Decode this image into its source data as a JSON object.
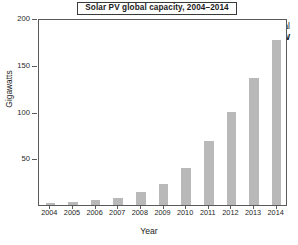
{
  "chart_data": {
    "type": "bar",
    "title": "Solar PV global capacity, 2004–2014",
    "xlabel": "Year",
    "ylabel": "Gigawatts",
    "categories": [
      "2004",
      "2005",
      "2006",
      "2007",
      "2008",
      "2009",
      "2010",
      "2011",
      "2012",
      "2013",
      "2014"
    ],
    "values": [
      2,
      3.5,
      5,
      7,
      14,
      22,
      40,
      68,
      99,
      136,
      177
    ],
    "ylim": [
      0,
      200
    ],
    "yticks": [
      0,
      50,
      100,
      150,
      200
    ],
    "ytick_labels": [
      "",
      "50",
      "100",
      "150",
      "200"
    ],
    "grid": false,
    "legend": null,
    "bar_color": "#b9b9b9",
    "frame_color": "#5a5a5a",
    "annotations": [
      {
        "line1": "World total",
        "line2": "177 GW"
      }
    ]
  },
  "axis": {
    "y_tick_values": [
      "200",
      "150",
      "100",
      "50"
    ],
    "x_tick_values": [
      "2004",
      "2005",
      "2006",
      "2007",
      "2008",
      "2009",
      "2010",
      "2011",
      "2012",
      "2013",
      "2014"
    ]
  },
  "annotation": {
    "line1": "World total",
    "line2": "177 GW"
  }
}
